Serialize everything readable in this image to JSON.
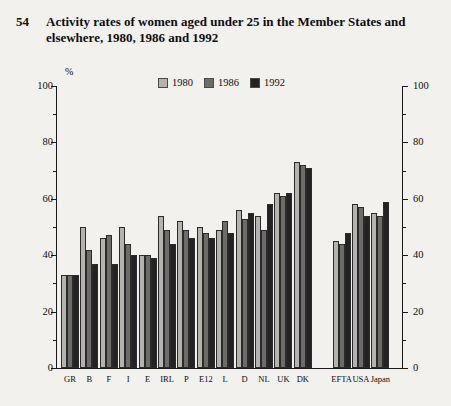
{
  "figure": {
    "number": "54",
    "title": "Activity rates of women aged under 25 in the Member States and elsewhere, 1980, 1986 and 1992",
    "unit_label": "%"
  },
  "legend": {
    "position": "top-center",
    "entries": [
      {
        "label": "1980",
        "color": "#b5b3ae"
      },
      {
        "label": "1986",
        "color": "#6e6c69"
      },
      {
        "label": "1992",
        "color": "#232323"
      }
    ]
  },
  "axes": {
    "y_left_ticks": [
      "0",
      "20",
      "40",
      "60",
      "80",
      "100"
    ],
    "y_right_ticks": [
      "0",
      "20",
      "40",
      "60",
      "80",
      "100"
    ],
    "y_min": 0,
    "y_max": 100,
    "y_major_step": 20,
    "y_minor_step": 10,
    "grid": false
  },
  "chart_data": {
    "type": "bar",
    "title": "Activity rates of women aged under 25 in the Member States and elsewhere, 1980, 1986 and 1992",
    "xlabel": "",
    "ylabel": "%",
    "ylim": [
      0,
      100
    ],
    "categories": [
      "GR",
      "B",
      "F",
      "I",
      "E",
      "IRL",
      "P",
      "E12",
      "L",
      "D",
      "NL",
      "UK",
      "DK",
      "",
      "EFTA",
      "USA",
      "Japan"
    ],
    "series": [
      {
        "name": "1980",
        "color": "#b5b3ae",
        "values": [
          33,
          50,
          46,
          50,
          40,
          54,
          52,
          50,
          49,
          56,
          54,
          62,
          73,
          null,
          45,
          58,
          55
        ]
      },
      {
        "name": "1986",
        "color": "#6e6c69",
        "values": [
          33,
          42,
          47,
          44,
          40,
          49,
          49,
          48,
          52,
          53,
          49,
          61,
          72,
          null,
          44,
          57,
          54
        ]
      },
      {
        "name": "1992",
        "color": "#232323",
        "values": [
          33,
          37,
          37,
          40,
          39,
          44,
          46,
          46,
          48,
          55,
          58,
          62,
          71,
          null,
          48,
          54,
          59
        ]
      }
    ]
  },
  "colors": {
    "background": "#f2f1ee",
    "axis": "#1a1a1a",
    "text": "#0d0d0d",
    "series_1980": "#b5b3ae",
    "series_1986": "#6e6c69",
    "series_1992": "#232323"
  }
}
